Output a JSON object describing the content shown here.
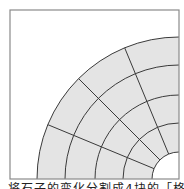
{
  "diagram": {
    "box": {
      "x": 10,
      "y": 10,
      "size": 169,
      "stroke": "#8a8a8a"
    },
    "center": {
      "x": 179,
      "y": 179
    },
    "radii": [
      27,
      56,
      84,
      114,
      142
    ],
    "sectors": 4,
    "fill": "#e4e4e4",
    "line_color": "#3a3a3a"
  },
  "caption": "将石子的变化分割成4块的「格子"
}
